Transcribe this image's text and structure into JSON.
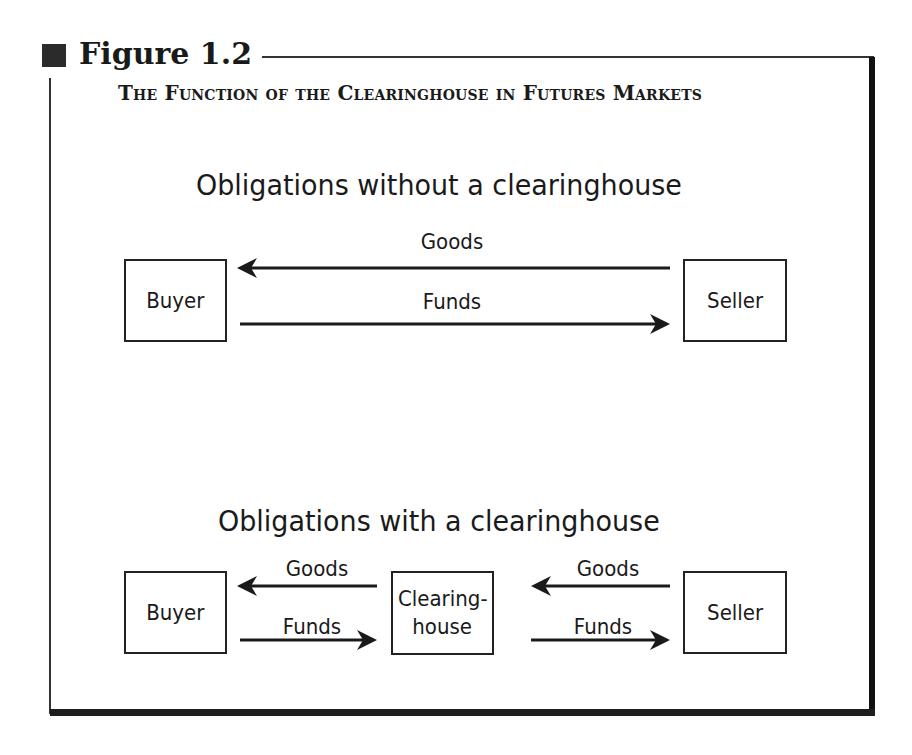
{
  "figure": {
    "label": "Figure 1.2",
    "title": "The Function of the Clearinghouse in Futures Markets"
  },
  "without_clearinghouse": {
    "heading": "Obligations without a clearinghouse",
    "nodes": {
      "buyer": "Buyer",
      "seller": "Seller"
    },
    "flows": [
      {
        "label": "Goods",
        "from": "Seller",
        "to": "Buyer"
      },
      {
        "label": "Funds",
        "from": "Buyer",
        "to": "Seller"
      }
    ]
  },
  "with_clearinghouse": {
    "heading": "Obligations with a clearinghouse",
    "nodes": {
      "buyer": "Buyer",
      "clearinghouse_line1": "Clearing-",
      "clearinghouse_line2": "house",
      "seller": "Seller"
    },
    "flows": [
      {
        "label": "Goods",
        "from": "Clearinghouse",
        "to": "Buyer"
      },
      {
        "label": "Funds",
        "from": "Buyer",
        "to": "Clearinghouse"
      },
      {
        "label": "Goods",
        "from": "Seller",
        "to": "Clearinghouse"
      },
      {
        "label": "Funds",
        "from": "Clearinghouse",
        "to": "Seller"
      }
    ]
  },
  "colors": {
    "ink": "#1a1a1a",
    "background": "#ffffff"
  }
}
